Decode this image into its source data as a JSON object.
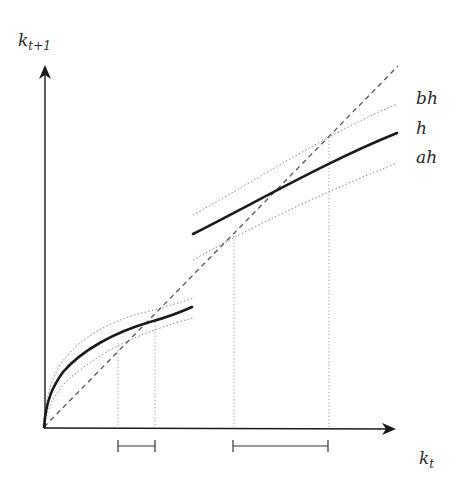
{
  "diagram": {
    "axes": {
      "x_label": "k",
      "x_label_sub": "t",
      "y_label": "k",
      "y_label_sub": "t+1"
    },
    "curves": [
      {
        "id": "bh",
        "label": "bh",
        "style": "dotted"
      },
      {
        "id": "h",
        "label": "h",
        "style": "solid-thick"
      },
      {
        "id": "ah",
        "label": "ah",
        "style": "dotted"
      }
    ],
    "reference_line": {
      "id": "45-degree",
      "style": "dashed"
    },
    "intervals": [
      {
        "id": "low-steady-state-interval",
        "from_px": 118,
        "to_px": 155
      },
      {
        "id": "high-steady-state-interval",
        "from_px": 233,
        "to_px": 328
      }
    ],
    "colors": {
      "axis": "#1a1a1a",
      "curve": "#1a1a1a",
      "dotted": "#8a8a8a",
      "dashed": "#555555"
    }
  }
}
